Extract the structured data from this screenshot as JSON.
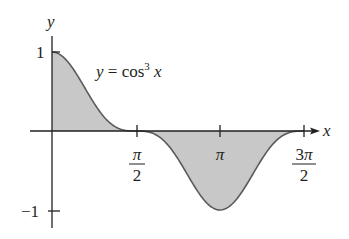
{
  "chart_data": {
    "type": "area",
    "title": "",
    "function_label": "y = cos³ x",
    "xlabel": "x",
    "ylabel": "y",
    "x_ticks": [
      {
        "value": 1.5708,
        "label_num": "π",
        "label_den": "2"
      },
      {
        "value": 3.1416,
        "label_num": "π",
        "label_den": ""
      },
      {
        "value": 4.7124,
        "label_num": "3π",
        "label_den": "2"
      }
    ],
    "y_ticks": [
      {
        "value": 1,
        "label": "1"
      },
      {
        "value": -1,
        "label": "−1"
      }
    ],
    "xlim": [
      0,
      4.7124
    ],
    "ylim": [
      -1,
      1
    ],
    "grid": false,
    "legend": "none",
    "series": [
      {
        "name": "cos³ x",
        "x": [
          0,
          0.3927,
          0.7854,
          1.1781,
          1.5708,
          1.9635,
          2.3562,
          2.7489,
          3.1416,
          3.5343,
          3.927,
          4.3197,
          4.7124
        ],
        "values": [
          1,
          0.788,
          0.354,
          0.056,
          0,
          -0.056,
          -0.354,
          -0.788,
          -1,
          -0.788,
          -0.354,
          -0.056,
          0
        ]
      }
    ],
    "colors": {
      "fill": "#c8c8c8",
      "curve": "#5a5a5a",
      "axis": "#231f20"
    }
  },
  "labels": {
    "y_axis": "y",
    "x_axis": "x",
    "y_tick_1": "1",
    "y_tick_neg1": "−1",
    "func_y": "y",
    "func_eq": " = cos",
    "func_exp": "3",
    "func_x": " x",
    "tick_pi2_num": "π",
    "tick_pi2_den": "2",
    "tick_pi": "π",
    "tick_3pi2_num": "3π",
    "tick_3pi2_den": "2"
  }
}
